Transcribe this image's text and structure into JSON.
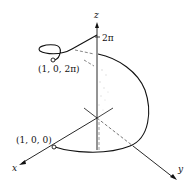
{
  "figure": {
    "type": "3d-helix-diagram",
    "axes": {
      "x_label": "x",
      "y_label": "y",
      "z_label": "z"
    },
    "tick": {
      "z_tick_label": "2π"
    },
    "points": [
      {
        "label": "(1, 0, 0)"
      },
      {
        "label": "(1, 0, 2π)"
      }
    ],
    "colors": {
      "line": "#111111",
      "dashed": "#555555",
      "shade": "#bbbbbb"
    }
  }
}
